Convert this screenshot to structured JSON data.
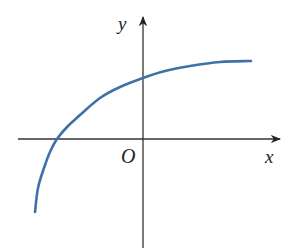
{
  "chart_data": {
    "type": "line",
    "title": "",
    "xlabel": "x",
    "ylabel": "y",
    "origin_label": "O",
    "grid": false,
    "legend": null,
    "series": [
      {
        "name": "curve",
        "color": "#3f71a8",
        "pixel_points": [
          [
            35,
            212
          ],
          [
            38,
            188
          ],
          [
            44,
            168
          ],
          [
            50,
            152
          ],
          [
            57,
            139
          ],
          [
            68,
            126
          ],
          [
            80,
            115
          ],
          [
            100,
            98
          ],
          [
            120,
            87
          ],
          [
            143,
            78
          ],
          [
            165,
            71
          ],
          [
            190,
            66
          ],
          [
            220,
            62
          ],
          [
            251,
            61
          ]
        ]
      }
    ],
    "axes": {
      "origin_px": [
        143,
        139
      ],
      "x_axis": {
        "from_px": 18,
        "to_px": 281
      },
      "y_axis": {
        "from_px": 248,
        "to_px": 16
      }
    },
    "colors": {
      "axis": "#333333",
      "curve": "#3f71a8",
      "text": "#222222"
    }
  }
}
